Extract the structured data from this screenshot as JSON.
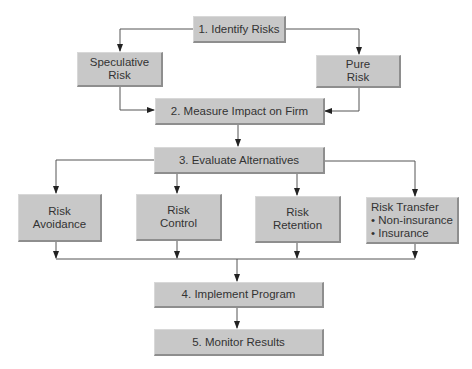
{
  "diagram": {
    "type": "flowchart",
    "colors": {
      "box_fill": "#c8c8c8",
      "box_shadow": "#8e8e8e",
      "text": "#333333",
      "line": "#555555",
      "background": "#ffffff"
    },
    "nodes": {
      "identify": {
        "label": "1. Identify Risks"
      },
      "speculative": {
        "lines": [
          "Speculative",
          "Risk"
        ]
      },
      "pure": {
        "lines": [
          "Pure",
          "Risk"
        ]
      },
      "measure": {
        "label": "2. Measure Impact on Firm"
      },
      "evaluate": {
        "label": "3. Evaluate Alternatives"
      },
      "avoidance": {
        "lines": [
          "Risk",
          "Avoidance"
        ]
      },
      "control": {
        "lines": [
          "Risk",
          "Control"
        ]
      },
      "retention": {
        "lines": [
          "Risk",
          "Retention"
        ]
      },
      "transfer": {
        "lines": [
          "Risk Transfer",
          "• Non-insurance",
          "• Insurance"
        ]
      },
      "implement": {
        "label": "4. Implement Program"
      },
      "monitor": {
        "label": "5. Monitor Results"
      }
    },
    "edges": [
      [
        "identify",
        "speculative"
      ],
      [
        "identify",
        "pure"
      ],
      [
        "speculative",
        "measure"
      ],
      [
        "pure",
        "measure"
      ],
      [
        "measure",
        "evaluate"
      ],
      [
        "evaluate",
        "avoidance"
      ],
      [
        "evaluate",
        "control"
      ],
      [
        "evaluate",
        "retention"
      ],
      [
        "evaluate",
        "transfer"
      ],
      [
        "avoidance",
        "implement"
      ],
      [
        "control",
        "implement"
      ],
      [
        "retention",
        "implement"
      ],
      [
        "transfer",
        "implement"
      ],
      [
        "implement",
        "monitor"
      ]
    ]
  }
}
